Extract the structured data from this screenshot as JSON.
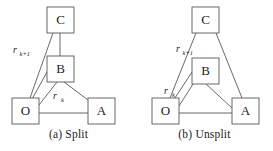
{
  "figure": {
    "panels": [
      {
        "id": "split",
        "caption": "(a) Split",
        "nodes": [
          {
            "name": "C",
            "label": "C",
            "x": 47,
            "y": 7,
            "w": 27,
            "h": 26
          },
          {
            "name": "B",
            "label": "B",
            "x": 47,
            "y": 56,
            "w": 27,
            "h": 26
          },
          {
            "name": "O",
            "label": "O",
            "x": 12,
            "y": 98,
            "w": 27,
            "h": 26
          },
          {
            "name": "A",
            "label": "A",
            "x": 88,
            "y": 98,
            "w": 27,
            "h": 26
          }
        ],
        "edges": [
          {
            "from": "O",
            "to": "C",
            "label": "r",
            "sub": "k+1"
          },
          {
            "from": "C",
            "to": "B",
            "label": "",
            "sub": ""
          },
          {
            "from": "O",
            "to": "B",
            "label": "",
            "sub": ""
          },
          {
            "from": "B",
            "to": "A",
            "label": "r",
            "sub": "k"
          },
          {
            "from": "O",
            "to": "A",
            "label": "",
            "sub": ""
          }
        ],
        "edge_labels": [
          {
            "base": "r",
            "sub": "k+1",
            "x": 13,
            "y": 53
          },
          {
            "base": "r",
            "sub": "k",
            "x": 53,
            "y": 99
          }
        ]
      },
      {
        "id": "unsplit",
        "caption": "(b) Unsplit",
        "nodes": [
          {
            "name": "C",
            "label": "C",
            "x": 56,
            "y": 7,
            "w": 27,
            "h": 26
          },
          {
            "name": "B",
            "label": "B",
            "x": 56,
            "y": 58,
            "w": 27,
            "h": 26
          },
          {
            "name": "O",
            "label": "O",
            "x": 16,
            "y": 98,
            "w": 27,
            "h": 26
          },
          {
            "name": "A",
            "label": "A",
            "x": 96,
            "y": 98,
            "w": 27,
            "h": 26
          }
        ],
        "edges": [
          {
            "from": "O",
            "to": "C",
            "label": "r",
            "sub": "k+1"
          },
          {
            "from": "C",
            "to": "A",
            "label": "",
            "sub": ""
          },
          {
            "from": "O",
            "to": "B",
            "label": "r",
            "sub": "k"
          },
          {
            "from": "B",
            "to": "A",
            "label": "",
            "sub": ""
          },
          {
            "from": "O",
            "to": "A",
            "label": "",
            "sub": ""
          }
        ],
        "edge_labels": [
          {
            "base": "r",
            "sub": "k+1",
            "x": 40,
            "y": 52
          },
          {
            "base": "r",
            "sub": "k",
            "x": 28,
            "y": 94
          }
        ]
      }
    ],
    "colors": {
      "stroke": "#585858",
      "text": "#1c1c1c",
      "background": "#ffffff"
    }
  }
}
